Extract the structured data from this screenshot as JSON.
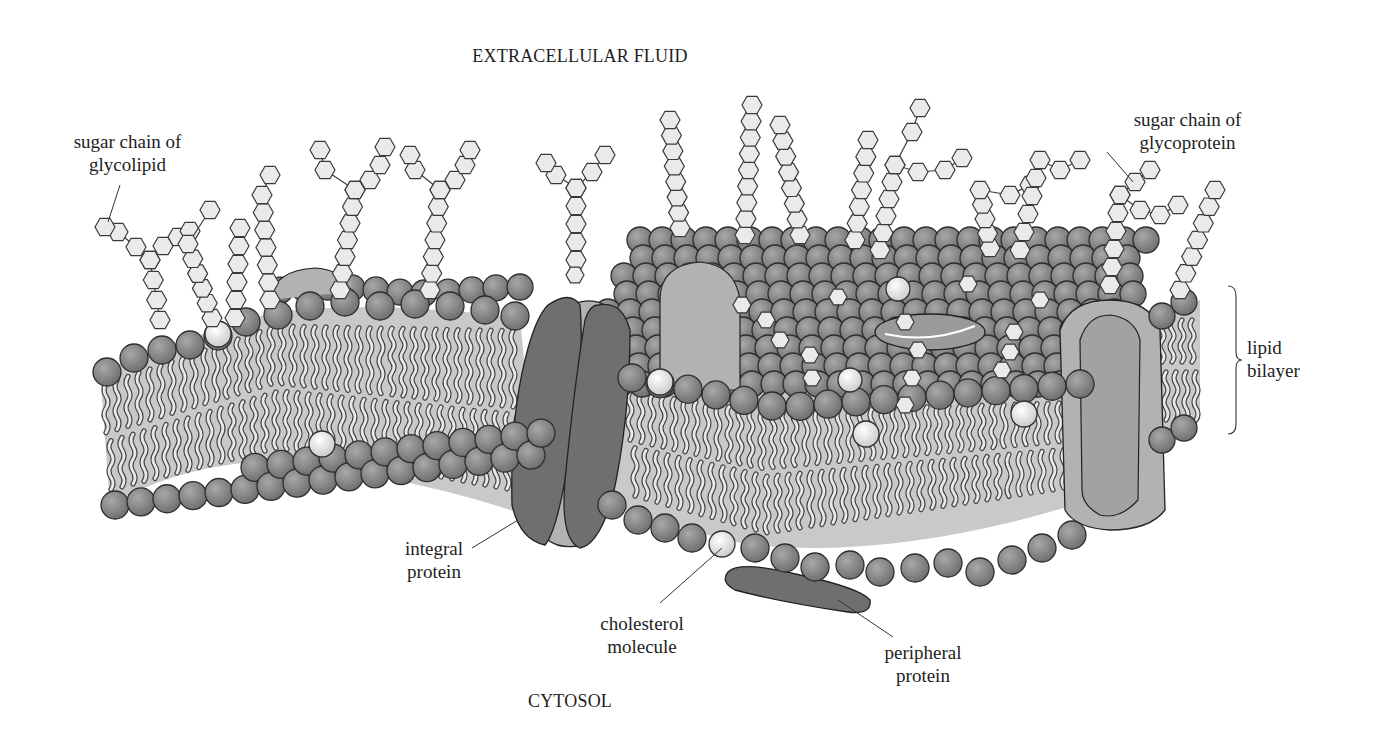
{
  "diagram": {
    "regions": {
      "top": "EXTRACELLULAR FLUID",
      "bottom": "CYTOSOL"
    },
    "labels": [
      {
        "id": "sugar-chain-glycolipid",
        "lines": [
          "sugar chain of",
          "glycolipid"
        ],
        "x": 58,
        "y": 130,
        "w": 140,
        "leader": [
          [
            120,
            185
          ],
          [
            108,
            222
          ]
        ]
      },
      {
        "id": "sugar-chain-glycoprotein",
        "lines": [
          "sugar chain of",
          "glycoprotein"
        ],
        "x": 1118,
        "y": 108,
        "w": 140,
        "leader": [
          [
            1107,
            152
          ],
          [
            1133,
            182
          ]
        ]
      },
      {
        "id": "lipid-bilayer",
        "lines": [
          "lipid",
          "bilayer"
        ],
        "x": 1247,
        "y": 335,
        "w": 80,
        "align": "left"
      },
      {
        "id": "integral-protein",
        "lines": [
          "integral",
          "protein"
        ],
        "x": 388,
        "y": 535,
        "w": 100,
        "leader": [
          [
            472,
            548
          ],
          [
            518,
            520
          ]
        ]
      },
      {
        "id": "cholesterol-molecule",
        "lines": [
          "cholesterol",
          "molecule"
        ],
        "x": 585,
        "y": 610,
        "w": 115,
        "leader": [
          [
            660,
            603
          ],
          [
            722,
            548
          ]
        ]
      },
      {
        "id": "peripheral-protein",
        "lines": [
          "peripheral",
          "protein"
        ],
        "x": 872,
        "y": 641,
        "w": 100,
        "leader": [
          [
            893,
            637
          ],
          [
            838,
            600
          ]
        ]
      }
    ],
    "colors": {
      "background": "#ffffff",
      "head": "#7f7f7f",
      "head_light": "#a6a6a6",
      "head_stroke": "#2e2e2e",
      "core": "#c9c9c9",
      "tail": "#e8e8e8",
      "protein_dark": "#6f6f6f",
      "protein_light": "#b2b2b2",
      "cholesterol": "#eeeeee",
      "sugar": "#eaeaea",
      "sugar_stroke": "#3a3a3a",
      "text": "#1e1e1e"
    }
  }
}
